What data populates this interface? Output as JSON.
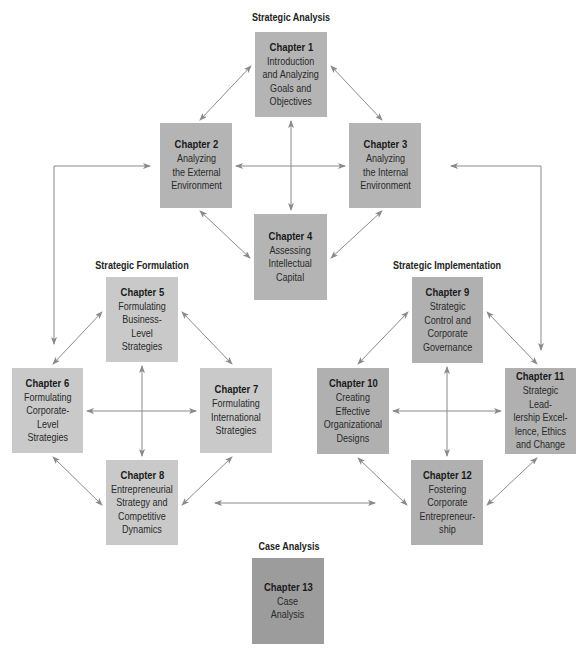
{
  "colors": {
    "analysis_box": "#b4b4b4",
    "formulation_box": "#c9c9c9",
    "implementation_box": "#b0b0b0",
    "case_box": "#9c9c9c",
    "arrow": "#8a8a8a"
  },
  "groups": {
    "analysis": {
      "title": "Strategic Analysis"
    },
    "formulation": {
      "title": "Strategic Formulation"
    },
    "implementation": {
      "title": "Strategic Implementation"
    },
    "case": {
      "title": "Case Analysis"
    }
  },
  "chapters": {
    "ch1": {
      "title": "Chapter 1",
      "subtitle": "Introduction\nand Analyzing\nGoals and\nObjectives"
    },
    "ch2": {
      "title": "Chapter 2",
      "subtitle": "Analyzing\nthe External\nEnvironment"
    },
    "ch3": {
      "title": "Chapter 3",
      "subtitle": "Analyzing\nthe Internal\nEnvironment"
    },
    "ch4": {
      "title": "Chapter 4",
      "subtitle": "Assessing\nIntellectual\nCapital"
    },
    "ch5": {
      "title": "Chapter 5",
      "subtitle": "Formulating\nBusiness-Level\nStrategies"
    },
    "ch6": {
      "title": "Chapter 6",
      "subtitle": "Formulating\nCorporate-\nLevel\nStrategies"
    },
    "ch7": {
      "title": "Chapter 7",
      "subtitle": "Formulating\nInternational\nStrategies"
    },
    "ch8": {
      "title": "Chapter 8",
      "subtitle": "Entrepreneurial\nStrategy and\nCompetitive\nDynamics"
    },
    "ch9": {
      "title": "Chapter 9",
      "subtitle": "Strategic\nControl and\nCorporate\nGovernance"
    },
    "ch10": {
      "title": "Chapter 10",
      "subtitle": "Creating\nEffective\nOrganizational\nDesigns"
    },
    "ch11": {
      "title": "Chapter 11",
      "subtitle": "Strategic Lead-\nlership Excel-\nlence, Ethics\nand Change"
    },
    "ch12": {
      "title": "Chapter 12",
      "subtitle": "Fostering\nCorporate\nEntrepreneur-\nship"
    },
    "ch13": {
      "title": "Chapter 13",
      "subtitle": "Case\nAnalysis"
    }
  }
}
